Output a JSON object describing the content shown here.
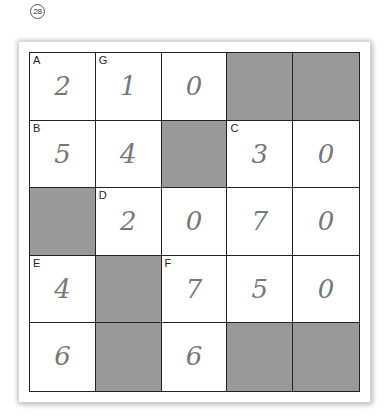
{
  "puzzle_number": "28",
  "grid": {
    "rows": 5,
    "cols": 5,
    "shade_color": "#999999",
    "cells": [
      [
        {
          "label": "A",
          "value": "2",
          "shaded": false
        },
        {
          "label": "G",
          "value": "1",
          "shaded": false
        },
        {
          "label": "",
          "value": "0",
          "shaded": false
        },
        {
          "label": "",
          "value": "",
          "shaded": true
        },
        {
          "label": "",
          "value": "",
          "shaded": true
        }
      ],
      [
        {
          "label": "B",
          "value": "5",
          "shaded": false
        },
        {
          "label": "",
          "value": "4",
          "shaded": false
        },
        {
          "label": "",
          "value": "",
          "shaded": true
        },
        {
          "label": "C",
          "value": "3",
          "shaded": false
        },
        {
          "label": "",
          "value": "0",
          "shaded": false
        }
      ],
      [
        {
          "label": "",
          "value": "",
          "shaded": true
        },
        {
          "label": "D",
          "value": "2",
          "shaded": false
        },
        {
          "label": "",
          "value": "0",
          "shaded": false
        },
        {
          "label": "",
          "value": "7",
          "shaded": false
        },
        {
          "label": "",
          "value": "0",
          "shaded": false
        }
      ],
      [
        {
          "label": "E",
          "value": "4",
          "shaded": false
        },
        {
          "label": "",
          "value": "",
          "shaded": true
        },
        {
          "label": "F",
          "value": "7",
          "shaded": false
        },
        {
          "label": "",
          "value": "5",
          "shaded": false
        },
        {
          "label": "",
          "value": "0",
          "shaded": false
        }
      ],
      [
        {
          "label": "",
          "value": "6",
          "shaded": false
        },
        {
          "label": "",
          "value": "",
          "shaded": true
        },
        {
          "label": "",
          "value": "6",
          "shaded": false
        },
        {
          "label": "",
          "value": "",
          "shaded": true
        },
        {
          "label": "",
          "value": "",
          "shaded": true
        }
      ]
    ]
  }
}
